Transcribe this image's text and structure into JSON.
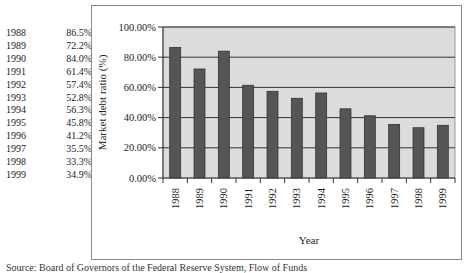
{
  "table": {
    "rows": [
      {
        "year": "1988",
        "value": "86.5%"
      },
      {
        "year": "1989",
        "value": "72.2%"
      },
      {
        "year": "1990",
        "value": "84.0%"
      },
      {
        "year": "1991",
        "value": "61.4%"
      },
      {
        "year": "1992",
        "value": "57.4%"
      },
      {
        "year": "1993",
        "value": "52.8%"
      },
      {
        "year": "1994",
        "value": "56.3%"
      },
      {
        "year": "1995",
        "value": "45.8%"
      },
      {
        "year": "1996",
        "value": "41.2%"
      },
      {
        "year": "1997",
        "value": "35.5%"
      },
      {
        "year": "1998",
        "value": "33.3%"
      },
      {
        "year": "1999",
        "value": "34.9%"
      }
    ]
  },
  "caption": "Source: Board of Governors of the Federal Reserve System, Flow of Funds",
  "colors": {
    "bar": "#555555",
    "plot_bg": "#dcdcdc",
    "grid": "#333333",
    "frame": "#8a8a8a"
  },
  "chart_data": {
    "type": "bar",
    "title": "",
    "xlabel": "Year",
    "ylabel": "Market debt ratio (%)",
    "categories": [
      "1988",
      "1989",
      "1990",
      "1991",
      "1992",
      "1993",
      "1994",
      "1995",
      "1996",
      "1997",
      "1998",
      "1999"
    ],
    "values": [
      86.5,
      72.2,
      84.0,
      61.4,
      57.4,
      52.8,
      56.3,
      45.8,
      41.2,
      35.5,
      33.3,
      34.9
    ],
    "ylim": [
      0,
      100
    ],
    "yticks": [
      "0.00%",
      "20.00%",
      "40.00%",
      "60.00%",
      "80.00%",
      "100.00%"
    ],
    "grid": true,
    "legend": null
  }
}
